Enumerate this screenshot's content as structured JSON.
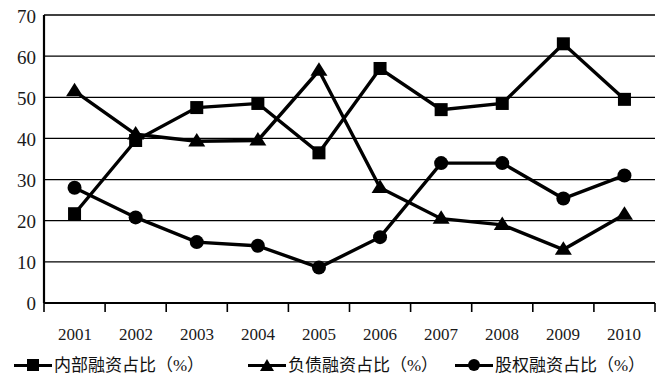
{
  "chart_data": {
    "type": "line",
    "title": "",
    "xlabel": "",
    "ylabel": "",
    "ylim": [
      0,
      70
    ],
    "ytick_step": 10,
    "yticks": [
      "0",
      "10",
      "20",
      "30",
      "40",
      "50",
      "60",
      "70"
    ],
    "grid": true,
    "legend_position": "bottom",
    "categories": [
      "2001",
      "2002",
      "2003",
      "2004",
      "2005",
      "2006",
      "2007",
      "2008",
      "2009",
      "2010"
    ],
    "series": [
      {
        "name": "内部融资占比（%）",
        "marker": "square",
        "color": "#000000",
        "values": [
          21.7,
          39.5,
          47.5,
          48.5,
          36.5,
          57.0,
          47.0,
          48.5,
          63.0,
          49.5
        ]
      },
      {
        "name": "负债融资占比（%）",
        "marker": "triangle",
        "color": "#000000",
        "values": [
          51.5,
          41.0,
          39.3,
          39.5,
          56.5,
          28.0,
          20.5,
          19.0,
          13.0,
          21.5
        ]
      },
      {
        "name": "股权融资占比（%）",
        "marker": "circle",
        "color": "#000000",
        "values": [
          28.0,
          20.8,
          14.8,
          13.9,
          8.6,
          16.0,
          34.0,
          34.0,
          25.4,
          31.0
        ]
      }
    ]
  },
  "axis": {
    "y_values": [
      70,
      60,
      50,
      40,
      30,
      20,
      10,
      0
    ]
  }
}
